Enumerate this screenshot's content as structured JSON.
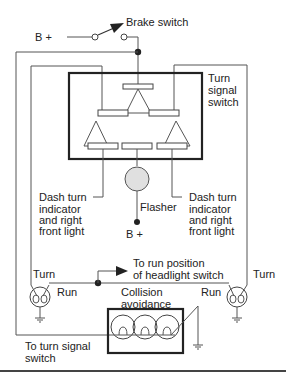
{
  "diagram": {
    "type": "wiring-schematic",
    "labels": {
      "b_plus_top": "B +",
      "brake_switch": "Brake switch",
      "turn_signal_switch_1": "Turn",
      "turn_signal_switch_2": "signal",
      "turn_signal_switch_3": "switch",
      "dash_left_1": "Dash turn",
      "dash_left_2": "indicator",
      "dash_left_3": "and right",
      "dash_left_4": "front light",
      "dash_right_1": "Dash turn",
      "dash_right_2": "indicator",
      "dash_right_3": "and right",
      "dash_right_4": "front light",
      "flasher": "Flasher",
      "b_plus_bottom": "B +",
      "turn_left": "Turn",
      "turn_right": "Turn",
      "run_left": "Run",
      "run_right": "Run",
      "headlight_1": "To run position",
      "headlight_2": "of headlight switch",
      "collision_1": "Collision",
      "collision_2": "avoidance",
      "to_turn_1": "To turn signal",
      "to_turn_2": "switch"
    },
    "components": [
      "brake-switch",
      "turn-signal-switch",
      "flasher",
      "left-turn-run-lamp",
      "right-turn-run-lamp",
      "collision-avoidance-lamp-cluster",
      "ground-symbols"
    ],
    "colors": {
      "line": "#555555",
      "box": "#222222",
      "flasher_fill": "#e0e0e0",
      "text": "#222222"
    }
  }
}
